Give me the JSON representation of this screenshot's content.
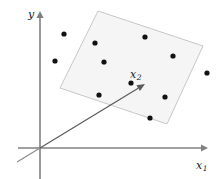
{
  "figure": {
    "width": 221,
    "height": 179,
    "background": "#ffffff"
  },
  "axes": {
    "vertical": {
      "label": "y",
      "label_plain": "y",
      "color": "#808080",
      "origin": [
        40,
        148
      ],
      "tip": [
        40,
        14
      ]
    },
    "horizontal": {
      "label_base": "x",
      "label_sub": "1",
      "label_plain": "x1",
      "color": "#808080",
      "origin": [
        40,
        148
      ],
      "tip": [
        205,
        148
      ],
      "start": [
        18,
        148
      ]
    }
  },
  "vector": {
    "label_base": "x",
    "label_sub": "2",
    "label_plain": "x2",
    "color": "#5a5a5a",
    "from": [
      40,
      148
    ],
    "to": [
      145,
      84
    ],
    "tail_extends_to": [
      17,
      162
    ]
  },
  "plane": {
    "name": "subspace-plane",
    "fill": "#f5f5f5",
    "stroke": "#c8c8c8",
    "corners": [
      [
        98,
        11
      ],
      [
        203,
        46
      ],
      [
        167,
        124
      ],
      [
        60,
        88
      ]
    ]
  },
  "chart_data": {
    "type": "scatter",
    "title": "",
    "xlabel": "x1",
    "ylabel": "y",
    "grid": false,
    "legend": null,
    "annotations": [
      {
        "text": "x2",
        "x": 138,
        "y": 75,
        "kind": "vector-label"
      }
    ],
    "point_color": "#111111",
    "point_radius": 2.6,
    "points": [
      {
        "x": 64,
        "y": 34
      },
      {
        "x": 95,
        "y": 43
      },
      {
        "x": 55,
        "y": 61
      },
      {
        "x": 104,
        "y": 62
      },
      {
        "x": 145,
        "y": 37
      },
      {
        "x": 173,
        "y": 56
      },
      {
        "x": 207,
        "y": 73
      },
      {
        "x": 99,
        "y": 95
      },
      {
        "x": 165,
        "y": 97
      },
      {
        "x": 150,
        "y": 118
      },
      {
        "x": 131,
        "y": 83
      }
    ]
  }
}
